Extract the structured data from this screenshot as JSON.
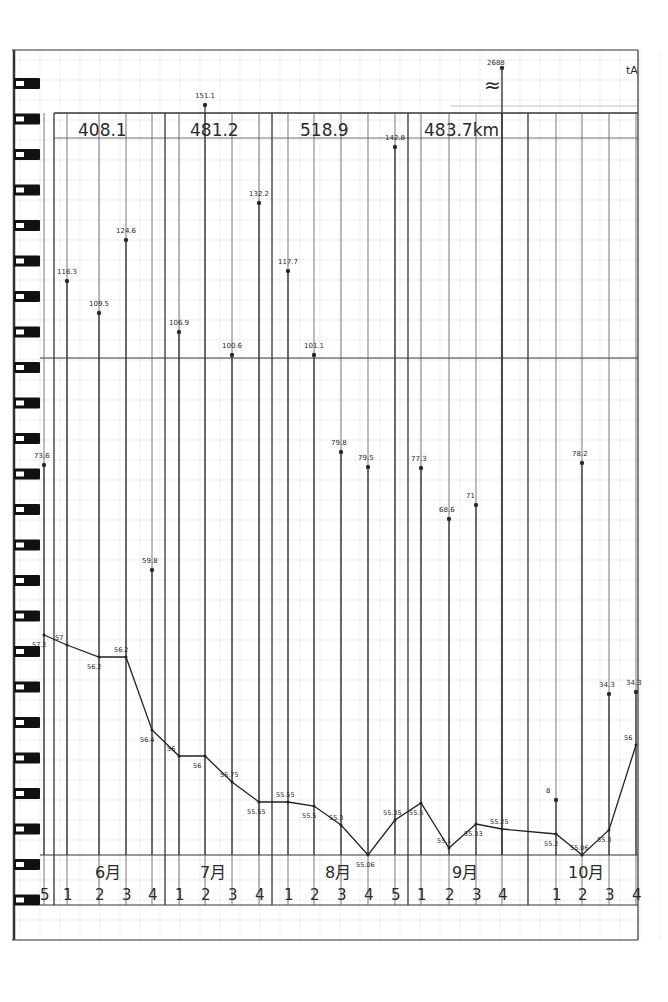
{
  "header": {
    "monthly_totals": [
      "408.1",
      "481.2",
      "518.9",
      "483.7km",
      ""
    ],
    "top_annotation": "2688",
    "break_symbol": "≈",
    "corner_mark": "tA"
  },
  "months": [
    {
      "label": "6月",
      "weeks": [
        "1",
        "2",
        "3",
        "4"
      ]
    },
    {
      "label": "7月",
      "weeks": [
        "1",
        "2",
        "3",
        "4"
      ]
    },
    {
      "label": "8月",
      "weeks": [
        "1",
        "2",
        "3",
        "4",
        "5"
      ]
    },
    {
      "label": "9月",
      "weeks": [
        "1",
        "2",
        "3",
        "4"
      ]
    },
    {
      "label": "10月",
      "weeks": [
        "1",
        "2",
        "3",
        "4"
      ]
    }
  ],
  "leading_week": "5",
  "colors": {
    "ink": "#2a2a2a",
    "grid": "#cfcfcf",
    "paper": "#ffffff",
    "ring": "#111111"
  },
  "chart_data": {
    "type": "bar+line",
    "xlabel": "Month / week",
    "categories": [
      "5/5",
      "6/1",
      "6/2",
      "6/3",
      "6/4",
      "7/1",
      "7/2",
      "7/3",
      "7/4",
      "8/1",
      "8/2",
      "8/3",
      "8/4",
      "8/5",
      "9/1",
      "9/2",
      "9/3",
      "9/4",
      "10/1",
      "10/2",
      "10/3",
      "10/4"
    ],
    "monthly_totals_km": {
      "6月": 408.1,
      "7月": 481.2,
      "8月": 518.9,
      "9月": 483.7
    },
    "series": [
      {
        "name": "weekly_distance_km",
        "type": "bar",
        "values": [
          73.6,
          116.3,
          109.5,
          124.6,
          59.8,
          106.9,
          151.1,
          100.6,
          132.2,
          117.7,
          101.1,
          79.8,
          79.5,
          142.8,
          77.3,
          68.6,
          71.0,
          268.8,
          8.0,
          78.2,
          34.3,
          34.3
        ]
      },
      {
        "name": "body_weight_kg",
        "type": "line",
        "values": [
          57.2,
          57.0,
          56.2,
          56.2,
          56.4,
          56.0,
          56.0,
          55.75,
          55.55,
          55.55,
          55.5,
          55.3,
          55.06,
          55.35,
          55.5,
          55.1,
          55.33,
          55.25,
          55.2,
          55.06,
          55.3,
          56.0
        ]
      }
    ],
    "annotations": [
      "2688 with break mark above 9月 week 4",
      "≈ axis break"
    ],
    "grid": true
  }
}
